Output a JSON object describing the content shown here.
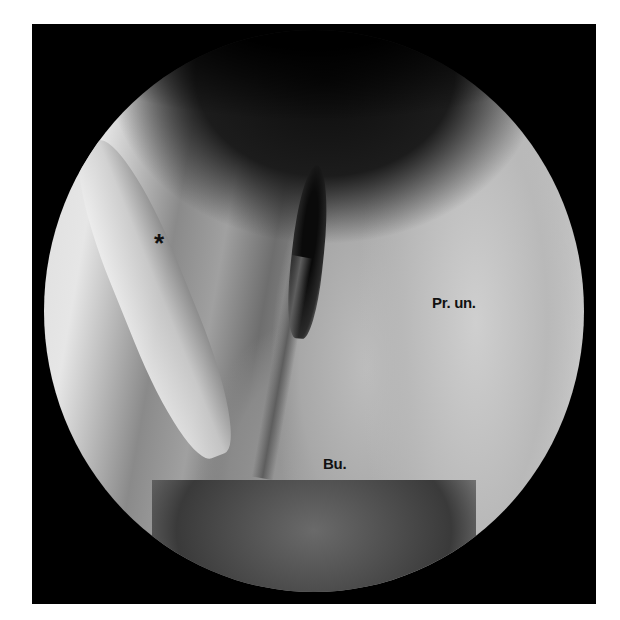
{
  "image": {
    "type": "endoscopic view",
    "colors": {
      "frame": "#000000",
      "background": "#ffffff",
      "label_text": "#111111"
    }
  },
  "labels": {
    "asterisk": "*",
    "processus_uncinatus": "Pr. un.",
    "bulla": "Bu."
  }
}
